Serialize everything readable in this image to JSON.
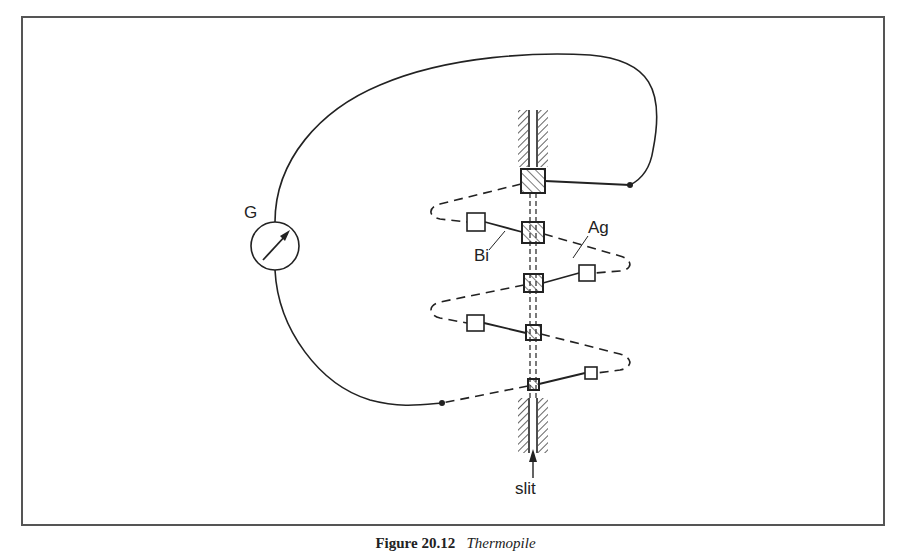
{
  "labels": {
    "galvanometer": "G",
    "metal_a": "Ag",
    "metal_b": "Bi",
    "slit": "slit"
  },
  "caption": {
    "figure": "Figure 20.12",
    "title": "Thermopile"
  },
  "colors": {
    "line": "#222222",
    "frame": "#555555",
    "background": "#ffffff"
  }
}
